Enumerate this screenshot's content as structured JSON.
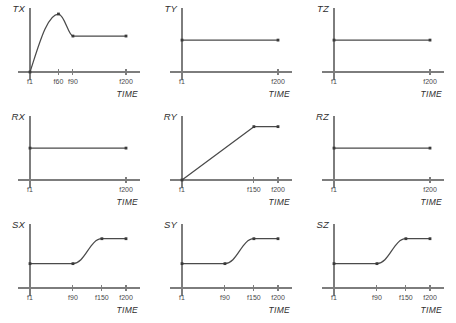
{
  "figure": {
    "xlabel": "TIME",
    "rows": 3,
    "cols": 3,
    "line_color": "#4a4a4a",
    "axis_color": "#7d7d7d",
    "background": "#ffffff"
  },
  "chart_data": [
    {
      "type": "line",
      "title": "TX",
      "ylabel": "TX",
      "xlabel": "TIME",
      "x_ticks": [
        "f1",
        "f60",
        "f90",
        "f200"
      ],
      "x_tick_values": [
        1,
        60,
        90,
        200
      ],
      "xlim": [
        1,
        200
      ],
      "ylim": [
        0,
        1
      ],
      "grid": false,
      "points": [
        {
          "x": 1,
          "y": 0.0
        },
        {
          "x": 60,
          "y": 1.0
        },
        {
          "x": 90,
          "y": 0.62
        },
        {
          "x": 200,
          "y": 0.62
        }
      ],
      "shape": "rise-peak-settle",
      "description": "Rises from zero at f1 to a peak at f60, decays to a plateau at f90 and stays constant to f200"
    },
    {
      "type": "line",
      "title": "TY",
      "ylabel": "TY",
      "xlabel": "TIME",
      "x_ticks": [
        "f1",
        "f200"
      ],
      "x_tick_values": [
        1,
        200
      ],
      "xlim": [
        1,
        200
      ],
      "ylim": [
        0,
        1
      ],
      "grid": false,
      "points": [
        {
          "x": 1,
          "y": 0.55
        },
        {
          "x": 200,
          "y": 0.55
        }
      ],
      "shape": "constant",
      "description": "Constant value from f1 to f200"
    },
    {
      "type": "line",
      "title": "TZ",
      "ylabel": "TZ",
      "xlabel": "TIME",
      "x_ticks": [
        "f1",
        "f200"
      ],
      "x_tick_values": [
        1,
        200
      ],
      "xlim": [
        1,
        200
      ],
      "ylim": [
        0,
        1
      ],
      "grid": false,
      "points": [
        {
          "x": 1,
          "y": 0.55
        },
        {
          "x": 200,
          "y": 0.55
        }
      ],
      "shape": "constant",
      "description": "Constant value from f1 to f200"
    },
    {
      "type": "line",
      "title": "RX",
      "ylabel": "RX",
      "xlabel": "TIME",
      "x_ticks": [
        "f1",
        "f200"
      ],
      "x_tick_values": [
        1,
        200
      ],
      "xlim": [
        1,
        200
      ],
      "ylim": [
        0,
        1
      ],
      "grid": false,
      "points": [
        {
          "x": 1,
          "y": 0.55
        },
        {
          "x": 200,
          "y": 0.55
        }
      ],
      "shape": "constant",
      "description": "Constant value from f1 to f200"
    },
    {
      "type": "line",
      "title": "RY",
      "ylabel": "RY",
      "xlabel": "TIME",
      "x_ticks": [
        "f1",
        "f150",
        "f200"
      ],
      "x_tick_values": [
        1,
        150,
        200
      ],
      "xlim": [
        1,
        200
      ],
      "ylim": [
        0,
        1
      ],
      "grid": false,
      "points": [
        {
          "x": 1,
          "y": 0.0
        },
        {
          "x": 150,
          "y": 0.92
        },
        {
          "x": 200,
          "y": 0.92
        }
      ],
      "shape": "linear-ramp-then-flat",
      "description": "Ramps linearly from zero at f1 up to f150, then holds constant to f200"
    },
    {
      "type": "line",
      "title": "RZ",
      "ylabel": "RZ",
      "xlabel": "TIME",
      "x_ticks": [
        "f1",
        "f200"
      ],
      "x_tick_values": [
        1,
        200
      ],
      "xlim": [
        1,
        200
      ],
      "ylim": [
        0,
        1
      ],
      "grid": false,
      "points": [
        {
          "x": 1,
          "y": 0.55
        },
        {
          "x": 200,
          "y": 0.55
        }
      ],
      "shape": "constant",
      "description": "Constant value from f1 to f200"
    },
    {
      "type": "line",
      "title": "SX",
      "ylabel": "SX",
      "xlabel": "TIME",
      "x_ticks": [
        "f1",
        "f90",
        "f150",
        "f200"
      ],
      "x_tick_values": [
        1,
        90,
        150,
        200
      ],
      "xlim": [
        1,
        200
      ],
      "ylim": [
        0,
        1
      ],
      "grid": false,
      "points": [
        {
          "x": 1,
          "y": 0.42
        },
        {
          "x": 90,
          "y": 0.42
        },
        {
          "x": 150,
          "y": 0.85
        },
        {
          "x": 200,
          "y": 0.85
        }
      ],
      "shape": "step-sigmoid",
      "description": "Flat from f1 to f90, smooth S-shaped rise from f90 to f150, flat again to f200"
    },
    {
      "type": "line",
      "title": "SY",
      "ylabel": "SY",
      "xlabel": "TIME",
      "x_ticks": [
        "f1",
        "f90",
        "f150",
        "f200"
      ],
      "x_tick_values": [
        1,
        90,
        150,
        200
      ],
      "xlim": [
        1,
        200
      ],
      "ylim": [
        0,
        1
      ],
      "grid": false,
      "points": [
        {
          "x": 1,
          "y": 0.42
        },
        {
          "x": 90,
          "y": 0.42
        },
        {
          "x": 150,
          "y": 0.85
        },
        {
          "x": 200,
          "y": 0.85
        }
      ],
      "shape": "step-sigmoid",
      "description": "Flat from f1 to f90, smooth S-shaped rise from f90 to f150, flat again to f200"
    },
    {
      "type": "line",
      "title": "SZ",
      "ylabel": "SZ",
      "xlabel": "TIME",
      "x_ticks": [
        "f1",
        "f90",
        "f150",
        "f200"
      ],
      "x_tick_values": [
        1,
        90,
        150,
        200
      ],
      "xlim": [
        1,
        200
      ],
      "ylim": [
        0,
        1
      ],
      "grid": false,
      "points": [
        {
          "x": 1,
          "y": 0.42
        },
        {
          "x": 90,
          "y": 0.42
        },
        {
          "x": 150,
          "y": 0.85
        },
        {
          "x": 200,
          "y": 0.85
        }
      ],
      "shape": "step-sigmoid",
      "description": "Flat from f1 to f90, smooth S-shaped rise from f90 to f150, flat again to f200"
    }
  ]
}
